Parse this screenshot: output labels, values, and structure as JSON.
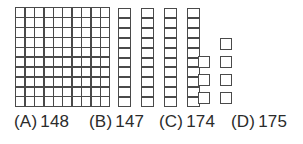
{
  "figure": {
    "type": "base-ten-blocks",
    "represented_value": 147,
    "groups": [
      {
        "name": "hundreds-flat",
        "block_type": "hundred",
        "count": 1,
        "rows": 10,
        "columns": 10,
        "unit_value": 100,
        "subtotal": 100
      },
      {
        "name": "tens-rods",
        "block_type": "ten",
        "count": 4,
        "cells_per_rod": 10,
        "unit_value": 10,
        "subtotal": 40
      },
      {
        "name": "ones-units",
        "block_type": "one",
        "count": 7,
        "left_column_count": 3,
        "right_column_count": 4,
        "unit_value": 1,
        "subtotal": 7
      }
    ]
  },
  "style": {
    "stroke_color": "#4a4a4a",
    "fill_color": "#ffffff",
    "background_color": "#ffffff",
    "text_color": "#2b2b2b"
  },
  "choices": [
    {
      "tag": "(A)",
      "value": "148",
      "left": 14
    },
    {
      "tag": "(B)",
      "value": "147",
      "left": 89
    },
    {
      "tag": "(C)",
      "value": "174",
      "left": 159
    },
    {
      "tag": "(D)",
      "value": "175",
      "left": 231
    }
  ]
}
